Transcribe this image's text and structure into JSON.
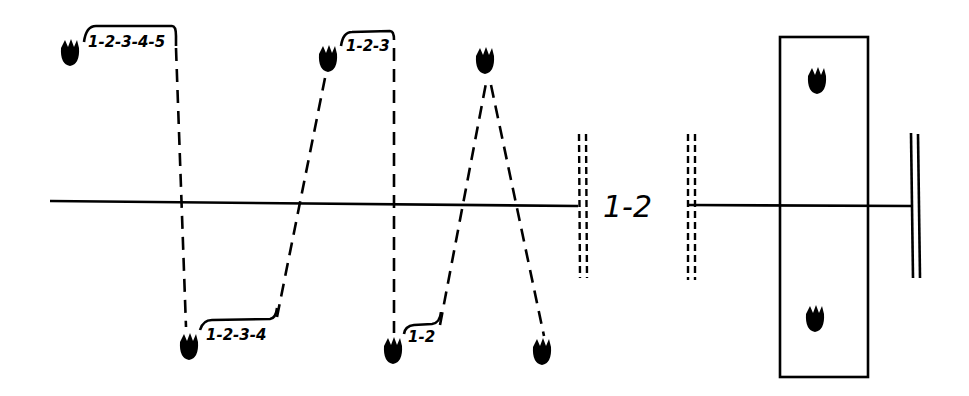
{
  "diagram": {
    "type": "sequence-comparison",
    "midline": {
      "y": 203
    },
    "left_panel": {
      "pads": [
        {
          "id": "p1",
          "x": 70,
          "y": 52,
          "side": "top",
          "label": "1-2-3-4-5"
        },
        {
          "id": "p2",
          "x": 189,
          "y": 346,
          "side": "bottom",
          "label": "1-2-3-4"
        },
        {
          "id": "p3",
          "x": 328,
          "y": 58,
          "side": "top",
          "label": "1-2-3"
        },
        {
          "id": "p4",
          "x": 393,
          "y": 350,
          "side": "bottom",
          "label": "1-2"
        },
        {
          "id": "p5",
          "x": 485,
          "y": 60,
          "side": "top",
          "label": ""
        },
        {
          "id": "p6",
          "x": 542,
          "y": 351,
          "side": "bottom",
          "label": ""
        }
      ],
      "end_marker": "double-dashed-bar"
    },
    "gap_label": "1-2",
    "right_panel": {
      "box": {
        "x": 780,
        "y": 37,
        "w": 88,
        "h": 340
      },
      "pads": [
        {
          "id": "r1",
          "x": 817,
          "y": 80
        },
        {
          "id": "r2",
          "x": 815,
          "y": 318
        }
      ],
      "end_marker": "double-solid-bar"
    }
  }
}
